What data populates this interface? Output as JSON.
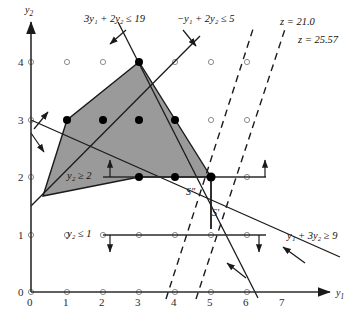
{
  "figure": {
    "type": "integer-programming-feasible-region",
    "axes": {
      "x_label": "y1",
      "y_label": "y2",
      "x_ticks": [
        "0",
        "1",
        "2",
        "3",
        "4",
        "5",
        "6",
        "7"
      ],
      "y_ticks": [
        "0",
        "1",
        "2",
        "3",
        "4"
      ],
      "xlim": [
        0,
        7.8
      ],
      "ylim": [
        0,
        4.6
      ]
    },
    "constraints": [
      {
        "name": "c1",
        "label": "3y₁ + 2y₂ ≤ 19",
        "text_x": 84,
        "text_y": 18
      },
      {
        "name": "c2",
        "label": "−y₁ + 2y₂ ≤ 5",
        "text_x": 177,
        "text_y": 18
      },
      {
        "name": "c3",
        "label": "y₂ ≥ 2",
        "text_x": 67,
        "text_y": 170
      },
      {
        "name": "c4",
        "label": "y₂ ≤ 1",
        "text_x": 67,
        "text_y": 228
      },
      {
        "name": "c5",
        "label": "y₁ + 3y₂ ≥ 9",
        "text_x": 287,
        "text_y": 232
      }
    ],
    "objective_lines": [
      {
        "name": "z-21",
        "label": "z = 21.0",
        "text_x": 280,
        "text_y": 20
      },
      {
        "name": "z-2557",
        "label": "z = 25.57",
        "text_x": 298,
        "text_y": 37
      }
    ],
    "region_labels": [
      {
        "name": "S-double-prime",
        "label": "S″",
        "text_x": 186,
        "text_y": 190
      },
      {
        "name": "S-prime",
        "label": "S′",
        "text_x": 212,
        "text_y": 211
      }
    ],
    "shaded_polygon": [
      [
        0.33,
        2.67
      ],
      [
        1,
        3
      ],
      [
        3,
        4
      ],
      [
        5,
        2
      ],
      [
        3,
        2
      ]
    ],
    "filled_points": [
      [
        1,
        3
      ],
      [
        2,
        3
      ],
      [
        3,
        3
      ],
      [
        4,
        3
      ],
      [
        3,
        4
      ],
      [
        3,
        2
      ],
      [
        4,
        2
      ],
      [
        5,
        2
      ]
    ],
    "lattice_grid": {
      "x_from": 0,
      "x_to": 7,
      "y_from": 0,
      "y_to": 4
    },
    "colors": {
      "shade_fill": "#9a9a9a",
      "line": "#1a1a1a",
      "axis": "#2b2b2b",
      "open_point_stroke": "#8c8c8c",
      "filled_point": "#000000",
      "background": "#ffffff"
    }
  }
}
